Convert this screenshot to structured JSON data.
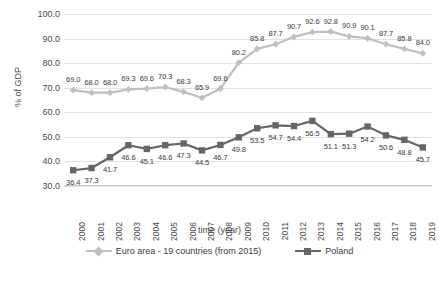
{
  "chart_data": {
    "type": "line",
    "title": "",
    "xlabel": "time (year)",
    "ylabel": "% of GDP",
    "ylim": [
      30.0,
      100.0
    ],
    "yticks": [
      "30.0",
      "40.0",
      "50.0",
      "60.0",
      "70.0",
      "80.0",
      "90.0",
      "100.0"
    ],
    "grid": true,
    "legend_position": "bottom",
    "categories": [
      "2000",
      "2001",
      "2002",
      "2003",
      "2004",
      "2005",
      "2006",
      "2007",
      "2008",
      "2009",
      "2010",
      "2011",
      "2012",
      "2013",
      "2014",
      "2015",
      "2016",
      "2017",
      "2018",
      "2019"
    ],
    "series": [
      {
        "name": "Euro area - 19 countries (from 2015)",
        "color": "#bfbfbf",
        "marker": "diamond",
        "values": [
          69.0,
          68.0,
          68.0,
          69.3,
          69.6,
          70.3,
          68.3,
          65.9,
          69.6,
          80.2,
          85.8,
          87.7,
          90.7,
          92.6,
          92.8,
          90.9,
          90.1,
          87.7,
          85.8,
          84.0
        ],
        "labels": [
          "69.0",
          "68.0",
          "68.0",
          "69.3",
          "69.6",
          "70.3",
          "68.3",
          "65.9",
          "69.6",
          "80.2",
          "85.8",
          "87.7",
          "90.7",
          "92.6",
          "92.8",
          "90.9",
          "90.1",
          "87.7",
          "85.8",
          "84.0"
        ]
      },
      {
        "name": "Poland",
        "color": "#666666",
        "marker": "square",
        "values": [
          36.4,
          37.3,
          41.7,
          46.6,
          45.1,
          46.6,
          47.3,
          44.5,
          46.7,
          49.8,
          53.5,
          54.7,
          54.4,
          56.5,
          51.1,
          51.3,
          54.2,
          50.6,
          48.8,
          45.7
        ],
        "labels": [
          "36.4",
          "37.3",
          "41.7",
          "46.6",
          "45.1",
          "46.6",
          "47.3",
          "44.5",
          "46.7",
          "49.8",
          "53.5",
          "54.7",
          "54.4",
          "56.5",
          "51.1",
          "51.3",
          "54.2",
          "50.6",
          "48.8",
          "45.7"
        ]
      }
    ]
  },
  "axes": {
    "y_title": "% of GDP",
    "x_title": "time (year)"
  },
  "legend": {
    "items": [
      {
        "label": "Euro area - 19 countries (from 2015)"
      },
      {
        "label": "Poland"
      }
    ]
  },
  "colors": {
    "euro_area": "#bfbfbf",
    "poland": "#666666",
    "gridline": "#e2e2e2",
    "text": "#3b3b3b"
  }
}
